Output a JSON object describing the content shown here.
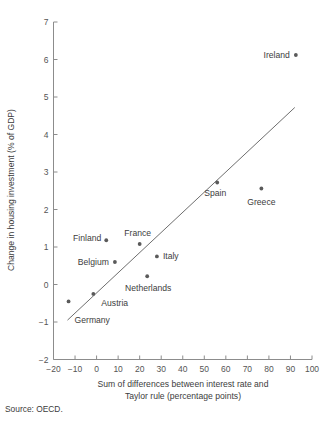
{
  "figure": {
    "source_note": "Source: OECD.",
    "accent_color": "#5a5a5a",
    "axis_color": "#8c8c8c",
    "background": "#ffffff"
  },
  "chart_data": {
    "type": "scatter",
    "title": "",
    "xlabel_line1": "Sum of differences between interest rate and",
    "xlabel_line2": "Taylor rule (percentage points)",
    "ylabel": "Change in housing investment (% of GDP)",
    "xlim": [
      -20,
      100
    ],
    "ylim": [
      -2,
      7
    ],
    "xticks": [
      -20,
      -10,
      0,
      10,
      20,
      30,
      40,
      50,
      60,
      70,
      80,
      90,
      100
    ],
    "xtick_labels": [
      "−20",
      "−10",
      "0",
      "10",
      "20",
      "30",
      "40",
      "50",
      "60",
      "70",
      "80",
      "90",
      "100"
    ],
    "yticks": [
      -2,
      -1,
      0,
      1,
      2,
      3,
      4,
      5,
      6,
      7
    ],
    "ytick_labels": [
      "−2",
      "−1",
      "0",
      "1",
      "2",
      "3",
      "4",
      "5",
      "6",
      "7"
    ],
    "grid": false,
    "legend": "none",
    "points": [
      {
        "name": "Germany",
        "x": -13.0,
        "y": -0.45,
        "label_dx": 6,
        "label_dy": 22,
        "anchor": "start"
      },
      {
        "name": "Austria",
        "x": -1.5,
        "y": -0.25,
        "label_dx": 8,
        "label_dy": 12,
        "anchor": "start"
      },
      {
        "name": "Belgium",
        "x": 8.5,
        "y": 0.6,
        "label_dx": -6,
        "label_dy": 3,
        "anchor": "end"
      },
      {
        "name": "Finland",
        "x": 4.5,
        "y": 1.18,
        "label_dx": -5,
        "label_dy": 1,
        "anchor": "end"
      },
      {
        "name": "France",
        "x": 20.0,
        "y": 1.08,
        "label_dx": -2,
        "label_dy": -8,
        "anchor": "middle"
      },
      {
        "name": "Netherlands",
        "x": 23.5,
        "y": 0.22,
        "label_dx": 1,
        "label_dy": 15,
        "anchor": "middle"
      },
      {
        "name": "Italy",
        "x": 28.0,
        "y": 0.75,
        "label_dx": 6,
        "label_dy": 3,
        "anchor": "start"
      },
      {
        "name": "Spain",
        "x": 56.0,
        "y": 2.72,
        "label_dx": -2,
        "label_dy": 13,
        "anchor": "middle"
      },
      {
        "name": "Greece",
        "x": 76.5,
        "y": 2.56,
        "label_dx": 0,
        "label_dy": 16,
        "anchor": "middle"
      },
      {
        "name": "Ireland",
        "x": 92.5,
        "y": 6.12,
        "label_dx": -6,
        "label_dy": 3,
        "anchor": "end"
      }
    ],
    "trend_line": {
      "label": "fitted regression line",
      "x_start": -13.5,
      "y_start": -0.95,
      "x_end": 92.0,
      "y_end": 4.72
    }
  }
}
